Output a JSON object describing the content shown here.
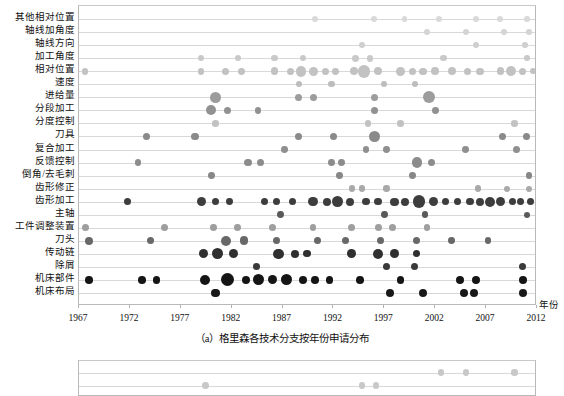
{
  "figure": {
    "caption_a": "（a）格里森各技术分支按年份申请分布",
    "axis_name": "年份"
  },
  "chart_data": {
    "type": "scatter",
    "title": "（a）格里森各技术分支按年份申请分布",
    "xlabel": "年份",
    "ylabel": "",
    "xlim": [
      1967,
      2012
    ],
    "ylim_categories_top_to_bottom": true,
    "grid": true,
    "legend": "none",
    "xticks": [
      1967,
      1972,
      1977,
      1982,
      1987,
      1992,
      1997,
      2002,
      2007,
      2012
    ],
    "categories": [
      "其他相对位置",
      "轴线加角度",
      "轴线方向",
      "加工角度",
      "相对位置",
      "速度",
      "进给量",
      "分段加工",
      "分度控制",
      "刀具",
      "复合加工",
      "反馈控制",
      "倒角/去毛刺",
      "齿形修正",
      "齿形加工",
      "主轴",
      "工件调整装置",
      "刀头",
      "传动链",
      "除屑",
      "机床部件",
      "机床布局"
    ],
    "encoding": {
      "x": "year",
      "y": "technology branch category",
      "size": "number of applications",
      "color": "density / count (light gray = few, black = many)"
    },
    "series": [
      {
        "name": "其他相对位置",
        "color": "#d9d9d9",
        "points": [
          {
            "x": 1990.2,
            "s": 3.4
          },
          {
            "x": 1996.0,
            "s": 3.0
          },
          {
            "x": 1999.0,
            "s": 2.8
          },
          {
            "x": 2002.4,
            "s": 3.0
          },
          {
            "x": 2006.0,
            "s": 3.2
          },
          {
            "x": 2008.4,
            "s": 3.0
          },
          {
            "x": 2011.0,
            "s": 2.8
          }
        ]
      },
      {
        "name": "轴线加角度",
        "color": "#d4d4d4",
        "points": [
          {
            "x": 2001.2,
            "s": 3.4
          },
          {
            "x": 2005.0,
            "s": 3.0
          },
          {
            "x": 2008.8,
            "s": 3.0
          },
          {
            "x": 2011.2,
            "s": 2.8
          }
        ]
      },
      {
        "name": "轴线方向",
        "color": "#cfcfcf",
        "points": [
          {
            "x": 1994.8,
            "s": 3.2
          },
          {
            "x": 2006.0,
            "s": 3.0
          },
          {
            "x": 2010.8,
            "s": 2.8
          }
        ]
      },
      {
        "name": "加工角度",
        "color": "#c9c9c9",
        "points": [
          {
            "x": 1979.0,
            "s": 3.2
          },
          {
            "x": 1982.6,
            "s": 3.2
          },
          {
            "x": 1986.2,
            "s": 3.2
          },
          {
            "x": 1989.0,
            "s": 3.0
          },
          {
            "x": 1994.2,
            "s": 3.4
          },
          {
            "x": 1995.6,
            "s": 3.4
          },
          {
            "x": 2002.8,
            "s": 3.2
          },
          {
            "x": 2011.0,
            "s": 2.8
          }
        ]
      },
      {
        "name": "相对位置",
        "color": "#c2c2c2",
        "points": [
          {
            "x": 1967.6,
            "s": 3.4
          },
          {
            "x": 1979.0,
            "s": 3.4
          },
          {
            "x": 1981.4,
            "s": 3.6
          },
          {
            "x": 1983.0,
            "s": 3.4
          },
          {
            "x": 1986.2,
            "s": 3.8
          },
          {
            "x": 1987.8,
            "s": 3.6
          },
          {
            "x": 1988.8,
            "s": 5.4
          },
          {
            "x": 1990.0,
            "s": 4.6
          },
          {
            "x": 1991.2,
            "s": 3.6
          },
          {
            "x": 1992.2,
            "s": 3.4
          },
          {
            "x": 1994.0,
            "s": 4.0
          },
          {
            "x": 1995.0,
            "s": 6.4
          },
          {
            "x": 1996.4,
            "s": 4.2
          },
          {
            "x": 1998.6,
            "s": 4.4
          },
          {
            "x": 1999.8,
            "s": 3.6
          },
          {
            "x": 2000.8,
            "s": 3.6
          },
          {
            "x": 2002.0,
            "s": 3.8
          },
          {
            "x": 2003.6,
            "s": 4.0
          },
          {
            "x": 2005.2,
            "s": 3.6
          },
          {
            "x": 2006.4,
            "s": 3.6
          },
          {
            "x": 2008.4,
            "s": 3.8
          },
          {
            "x": 2009.4,
            "s": 5.0
          },
          {
            "x": 2010.6,
            "s": 3.6
          },
          {
            "x": 2011.6,
            "s": 3.0
          }
        ]
      },
      {
        "name": "速度",
        "color": "#bdbdbd",
        "points": [
          {
            "x": 1988.6,
            "s": 3.2
          },
          {
            "x": 1991.8,
            "s": 3.2
          },
          {
            "x": 1997.0,
            "s": 3.2
          },
          {
            "x": 2000.0,
            "s": 3.2
          }
        ]
      },
      {
        "name": "进给量",
        "color": "#9c9c9c",
        "points": [
          {
            "x": 1980.4,
            "s": 5.6
          },
          {
            "x": 1988.6,
            "s": 3.6
          },
          {
            "x": 1990.0,
            "s": 3.6
          },
          {
            "x": 1996.0,
            "s": 3.6
          },
          {
            "x": 2001.4,
            "s": 6.0
          }
        ]
      },
      {
        "name": "分段加工",
        "color": "#919191",
        "points": [
          {
            "x": 1980.0,
            "s": 5.2
          },
          {
            "x": 1981.6,
            "s": 3.8
          },
          {
            "x": 1984.6,
            "s": 3.4
          },
          {
            "x": 1996.0,
            "s": 3.6
          },
          {
            "x": 2002.0,
            "s": 3.4
          }
        ]
      },
      {
        "name": "分度控制",
        "color": "#c2c2c2",
        "points": [
          {
            "x": 1980.4,
            "s": 3.2
          },
          {
            "x": 1995.4,
            "s": 3.2
          },
          {
            "x": 1998.6,
            "s": 3.2
          },
          {
            "x": 2009.8,
            "s": 3.2
          }
        ]
      },
      {
        "name": "刀具",
        "color": "#8a8a8a",
        "points": [
          {
            "x": 1973.6,
            "s": 3.6
          },
          {
            "x": 1978.4,
            "s": 3.6
          },
          {
            "x": 1988.6,
            "s": 3.6
          },
          {
            "x": 1992.0,
            "s": 3.6
          },
          {
            "x": 1996.0,
            "s": 5.4
          },
          {
            "x": 2008.6,
            "s": 3.6
          },
          {
            "x": 2011.0,
            "s": 3.6
          }
        ]
      },
      {
        "name": "复合加工",
        "color": "#8f8f8f",
        "points": [
          {
            "x": 1987.2,
            "s": 3.4
          },
          {
            "x": 1995.2,
            "s": 3.4
          },
          {
            "x": 1997.2,
            "s": 3.4
          },
          {
            "x": 2005.0,
            "s": 3.4
          },
          {
            "x": 2010.0,
            "s": 3.6
          }
        ]
      },
      {
        "name": "反馈控制",
        "color": "#8c8c8c",
        "points": [
          {
            "x": 1972.8,
            "s": 3.4
          },
          {
            "x": 1983.6,
            "s": 3.6
          },
          {
            "x": 1984.8,
            "s": 3.6
          },
          {
            "x": 1991.8,
            "s": 3.4
          },
          {
            "x": 1992.8,
            "s": 3.4
          },
          {
            "x": 2000.2,
            "s": 5.2
          },
          {
            "x": 2001.6,
            "s": 3.6
          }
        ]
      },
      {
        "name": "倒角/去毛刺",
        "color": "#878787",
        "points": [
          {
            "x": 1980.0,
            "s": 3.4
          },
          {
            "x": 1992.6,
            "s": 3.4
          },
          {
            "x": 1999.8,
            "s": 3.4
          },
          {
            "x": 2011.2,
            "s": 3.4
          }
        ]
      },
      {
        "name": "齿形修正",
        "color": "#a9a9a9",
        "points": [
          {
            "x": 1993.8,
            "s": 3.2
          },
          {
            "x": 1994.8,
            "s": 3.2
          },
          {
            "x": 1997.2,
            "s": 3.2
          },
          {
            "x": 2006.2,
            "s": 3.2
          },
          {
            "x": 2009.0,
            "s": 3.0
          },
          {
            "x": 2011.2,
            "s": 3.0
          }
        ]
      },
      {
        "name": "齿形加工",
        "color": "#3d3d3d",
        "points": [
          {
            "x": 1971.8,
            "s": 3.6
          },
          {
            "x": 1979.0,
            "s": 4.6
          },
          {
            "x": 1980.4,
            "s": 3.8
          },
          {
            "x": 1981.8,
            "s": 3.4
          },
          {
            "x": 1985.2,
            "s": 3.6
          },
          {
            "x": 1986.4,
            "s": 3.6
          },
          {
            "x": 1988.0,
            "s": 3.6
          },
          {
            "x": 1990.0,
            "s": 4.8
          },
          {
            "x": 1991.4,
            "s": 4.0
          },
          {
            "x": 1992.4,
            "s": 5.4
          },
          {
            "x": 1993.6,
            "s": 4.0
          },
          {
            "x": 1995.2,
            "s": 3.8
          },
          {
            "x": 1996.4,
            "s": 3.8
          },
          {
            "x": 1998.0,
            "s": 4.2
          },
          {
            "x": 1999.0,
            "s": 4.0
          },
          {
            "x": 2000.4,
            "s": 6.4
          },
          {
            "x": 2001.8,
            "s": 4.6
          },
          {
            "x": 2003.0,
            "s": 3.6
          },
          {
            "x": 2004.2,
            "s": 3.8
          },
          {
            "x": 2005.4,
            "s": 3.8
          },
          {
            "x": 2006.4,
            "s": 4.2
          },
          {
            "x": 2007.4,
            "s": 5.2
          },
          {
            "x": 2008.4,
            "s": 4.6
          },
          {
            "x": 2009.6,
            "s": 3.6
          },
          {
            "x": 2010.4,
            "s": 3.6
          },
          {
            "x": 2011.4,
            "s": 3.6
          }
        ]
      },
      {
        "name": "主轴",
        "color": "#5a5a5a",
        "points": [
          {
            "x": 1986.8,
            "s": 3.4
          },
          {
            "x": 1997.0,
            "s": 3.4
          },
          {
            "x": 2001.0,
            "s": 3.4
          },
          {
            "x": 2011.0,
            "s": 3.2
          }
        ]
      },
      {
        "name": "工件调整装置",
        "color": "#9e9e9e",
        "points": [
          {
            "x": 1967.6,
            "s": 3.6
          },
          {
            "x": 1975.4,
            "s": 3.6
          },
          {
            "x": 1980.2,
            "s": 3.4
          },
          {
            "x": 1982.6,
            "s": 3.4
          },
          {
            "x": 1986.0,
            "s": 3.6
          },
          {
            "x": 1990.0,
            "s": 3.4
          },
          {
            "x": 1993.8,
            "s": 3.6
          },
          {
            "x": 1996.4,
            "s": 3.4
          },
          {
            "x": 1997.8,
            "s": 3.6
          },
          {
            "x": 2001.2,
            "s": 3.4
          }
        ]
      },
      {
        "name": "刀头",
        "color": "#686868",
        "points": [
          {
            "x": 1968.0,
            "s": 4.0
          },
          {
            "x": 1974.0,
            "s": 3.6
          },
          {
            "x": 1981.4,
            "s": 5.0
          },
          {
            "x": 1983.2,
            "s": 4.4
          },
          {
            "x": 1986.4,
            "s": 3.6
          },
          {
            "x": 1990.4,
            "s": 3.6
          },
          {
            "x": 1993.2,
            "s": 3.6
          },
          {
            "x": 1996.6,
            "s": 3.6
          },
          {
            "x": 2000.2,
            "s": 3.6
          },
          {
            "x": 2003.6,
            "s": 3.4
          },
          {
            "x": 2007.2,
            "s": 3.4
          }
        ]
      },
      {
        "name": "传动链",
        "color": "#2f2f2f",
        "points": [
          {
            "x": 1979.2,
            "s": 4.6
          },
          {
            "x": 1980.6,
            "s": 5.6
          },
          {
            "x": 1982.2,
            "s": 4.6
          },
          {
            "x": 1986.6,
            "s": 5.2
          },
          {
            "x": 1988.2,
            "s": 4.0
          },
          {
            "x": 1989.4,
            "s": 3.6
          },
          {
            "x": 1993.8,
            "s": 4.4
          },
          {
            "x": 1996.4,
            "s": 5.0
          },
          {
            "x": 1998.0,
            "s": 4.4
          },
          {
            "x": 2000.2,
            "s": 3.6
          }
        ]
      },
      {
        "name": "除屑",
        "color": "#3a3a3a",
        "points": [
          {
            "x": 1984.4,
            "s": 3.6
          },
          {
            "x": 1997.2,
            "s": 3.6
          },
          {
            "x": 2000.0,
            "s": 3.6
          },
          {
            "x": 2010.6,
            "s": 3.6
          }
        ]
      },
      {
        "name": "机床部件",
        "color": "#151515",
        "points": [
          {
            "x": 1968.0,
            "s": 3.8
          },
          {
            "x": 1973.2,
            "s": 3.8
          },
          {
            "x": 1974.6,
            "s": 3.8
          },
          {
            "x": 1979.4,
            "s": 5.2
          },
          {
            "x": 1981.6,
            "s": 6.6
          },
          {
            "x": 1983.4,
            "s": 4.2
          },
          {
            "x": 1984.6,
            "s": 5.6
          },
          {
            "x": 1986.0,
            "s": 4.6
          },
          {
            "x": 1987.4,
            "s": 5.6
          },
          {
            "x": 1989.0,
            "s": 4.0
          },
          {
            "x": 1990.2,
            "s": 3.8
          },
          {
            "x": 1991.6,
            "s": 3.8
          },
          {
            "x": 1994.6,
            "s": 3.8
          },
          {
            "x": 1998.6,
            "s": 3.8
          },
          {
            "x": 2004.4,
            "s": 4.0
          },
          {
            "x": 2006.0,
            "s": 4.0
          },
          {
            "x": 2010.6,
            "s": 4.0
          }
        ]
      },
      {
        "name": "机床布局",
        "color": "#181818",
        "points": [
          {
            "x": 1980.4,
            "s": 4.4
          },
          {
            "x": 1997.6,
            "s": 4.0
          },
          {
            "x": 2000.8,
            "s": 4.0
          },
          {
            "x": 2004.8,
            "s": 4.0
          },
          {
            "x": 2005.8,
            "s": 4.0
          },
          {
            "x": 2010.6,
            "s": 4.0
          }
        ]
      }
    ]
  },
  "chart_b_partial": {
    "categories": [
      "其他相对位置",
      "轴线加角度"
    ],
    "series": [
      {
        "name": "其他相对位置",
        "color": "#c8c8c8",
        "points": [
          {
            "x": 2002.6,
            "s": 3.2
          },
          {
            "x": 2005.0,
            "s": 3.2
          },
          {
            "x": 2009.8,
            "s": 3.2
          }
        ]
      },
      {
        "name": "轴线加角度",
        "color": "#c8c8c8",
        "points": [
          {
            "x": 1979.4,
            "s": 3.4
          },
          {
            "x": 1994.8,
            "s": 3.2
          },
          {
            "x": 1996.2,
            "s": 3.2
          }
        ]
      }
    ]
  }
}
